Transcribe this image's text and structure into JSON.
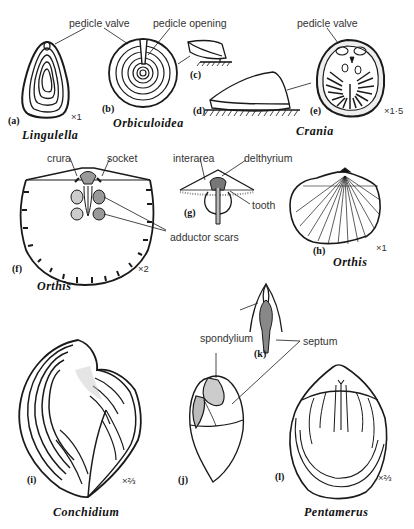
{
  "figures": [
    {
      "id": "a",
      "label": "(a)",
      "genus": "Lingulella",
      "scale": "×1"
    },
    {
      "id": "b",
      "label": "(b)",
      "genus": "Orbiculoidea"
    },
    {
      "id": "c",
      "label": "(c)"
    },
    {
      "id": "d",
      "label": "(d)"
    },
    {
      "id": "e",
      "label": "(e)",
      "genus": "Crania",
      "scale": "×1·5"
    },
    {
      "id": "f",
      "label": "(f)",
      "genus": "Orthis",
      "scale": "×2"
    },
    {
      "id": "g",
      "label": "(g)"
    },
    {
      "id": "h",
      "label": "(h)",
      "genus": "Orthis",
      "scale": "×1"
    },
    {
      "id": "i",
      "label": "(i)",
      "genus": "Conchidium",
      "scale": "×⅔"
    },
    {
      "id": "j",
      "label": "(j)"
    },
    {
      "id": "k",
      "label": "(k)"
    },
    {
      "id": "l",
      "label": "(l)",
      "genus": "Pentamerus",
      "scale": "×⅔"
    }
  ],
  "annotations": {
    "pedicle_valve_left": "pedicle valve",
    "pedicle_opening": "pedicle opening",
    "pedicle_valve_right": "pedicle valve",
    "crura": "crura",
    "socket": "socket",
    "interarea": "interarea",
    "delthyrium": "delthyrium",
    "tooth": "tooth",
    "adductor_scars": "adductor scars",
    "spondylium": "spondylium",
    "septum": "septum"
  }
}
